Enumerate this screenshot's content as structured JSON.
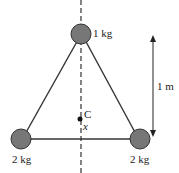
{
  "diagram": {
    "masses": [
      {
        "id": "top",
        "label": "1 kg"
      },
      {
        "id": "left",
        "label": "2 kg"
      },
      {
        "id": "right",
        "label": "2 kg"
      }
    ],
    "center_label": "C",
    "distance_label": "x",
    "height_label": "1 m",
    "colors": {
      "ball": "#777777",
      "line": "#333333"
    }
  }
}
